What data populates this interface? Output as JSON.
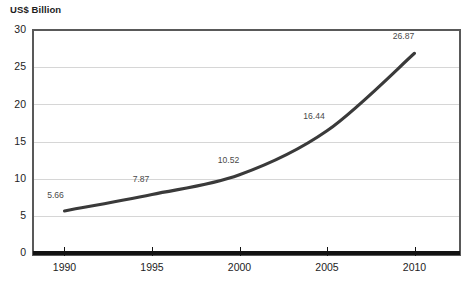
{
  "chart_data": {
    "type": "line",
    "title": "",
    "subtitle": "",
    "xlabel": "",
    "ylabel": "US$ Billion",
    "ylim": [
      0,
      30
    ],
    "xlim": [
      1988.2,
      2012.6
    ],
    "yticks": [
      "0",
      "5",
      "10",
      "15",
      "20",
      "25",
      "30"
    ],
    "ytick_values": [
      0,
      5,
      10,
      15,
      20,
      25,
      30
    ],
    "xticks": [
      "1990",
      "1995",
      "2000",
      "2005",
      "2010"
    ],
    "xtick_values": [
      1990,
      1995,
      2000,
      2005,
      2010
    ],
    "categories": [
      1990,
      1995,
      2000,
      2005,
      2010
    ],
    "values": [
      5.66,
      7.87,
      10.52,
      16.44,
      26.87
    ],
    "point_labels": [
      "5.66",
      "7.87",
      "10.52",
      "16.44",
      "26.87"
    ],
    "grid": true,
    "grid_axis": "y",
    "legend": false,
    "legend_position": "none",
    "colors": {
      "line": "#3a3a3a",
      "grid": "#d6d6d6",
      "frame": "#595959",
      "baseline": "#121212",
      "label_text": "#4a4a4a",
      "tick_text": "#1d1d1d",
      "background": "#ffffff"
    }
  }
}
